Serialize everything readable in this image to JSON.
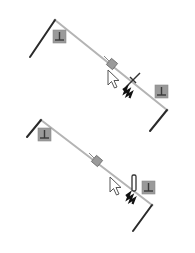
{
  "colors": {
    "background": "#ffffff",
    "sketch_line": "#2a2a2a",
    "preview_line": "#b4b4b4",
    "relation_icon_fill": "#9a9a9a",
    "relation_icon_glyph": "#3a3a3a",
    "cursor_fill": "#ffffff",
    "cursor_stroke": "#555555",
    "marker_fill": "#9a9a9a"
  },
  "figures": [
    {
      "id": "top",
      "sketch_lines": [
        {
          "x1": 30,
          "y1": 57,
          "x2": 55,
          "y2": 20
        },
        {
          "x1": 167,
          "y1": 110,
          "x2": 150,
          "y2": 131
        }
      ],
      "preview_line": {
        "x1": 55,
        "y1": 20,
        "x2": 167,
        "y2": 110
      },
      "relation_icons": [
        {
          "name": "perpendicular-relation-icon",
          "x": 53,
          "y": 30,
          "size": 13
        },
        {
          "name": "perpendicular-relation-icon",
          "x": 155,
          "y": 85,
          "size": 13
        }
      ],
      "midpoint_marker": {
        "x": 112,
        "y": 64
      },
      "cursor": {
        "x": 108,
        "y": 70
      },
      "cursor_badge": {
        "type": "crosshair",
        "x": 133,
        "y": 80
      },
      "zigzag": {
        "x": 123,
        "y": 90
      }
    },
    {
      "id": "bottom",
      "sketch_lines": [
        {
          "x1": 27,
          "y1": 137,
          "x2": 41,
          "y2": 120
        },
        {
          "x1": 152,
          "y1": 205,
          "x2": 133,
          "y2": 231
        }
      ],
      "preview_line": {
        "x1": 41,
        "y1": 120,
        "x2": 152,
        "y2": 205
      },
      "relation_icons": [
        {
          "name": "perpendicular-relation-icon",
          "x": 38,
          "y": 128,
          "size": 13
        },
        {
          "name": "perpendicular-relation-icon",
          "x": 142,
          "y": 181,
          "size": 13
        }
      ],
      "midpoint_marker": {
        "x": 97,
        "y": 161
      },
      "cursor": {
        "x": 110,
        "y": 177
      },
      "cursor_badge": {
        "type": "vertical-bar",
        "x": 134,
        "y": 177
      },
      "zigzag": {
        "x": 126,
        "y": 196
      }
    }
  ]
}
